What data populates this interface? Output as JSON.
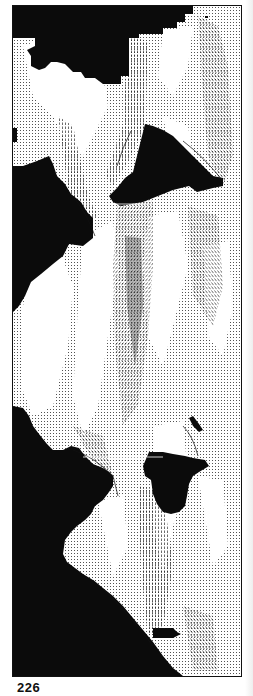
{
  "page": {
    "number": "226"
  },
  "figure": {
    "type": "vector-field-plot",
    "colors": {
      "mask": "#0b0b0b",
      "background": "#ffffff",
      "vectors": "#222222"
    }
  }
}
